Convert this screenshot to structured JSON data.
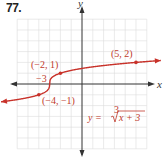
{
  "problem_number": "77.",
  "colors": {
    "curve": "#c8322a",
    "grid": "#dcdcdc",
    "axis": "#333333",
    "label": "#c0392b"
  },
  "chart_data": {
    "type": "line",
    "title": "",
    "xlabel": "x",
    "ylabel": "y",
    "xlim": [
      -6,
      6
    ],
    "ylim": [
      -6,
      6
    ],
    "grid": true,
    "equation": "y = ∛(x + 3)",
    "series": [
      {
        "name": "y = cbrt(x+3)",
        "function": "cbrt(x+3)",
        "x_range": [
          -7.5,
          7.3
        ],
        "arrows_both_ends": true
      }
    ],
    "points": [
      {
        "x": 5,
        "y": 2,
        "label": "(5, 2)"
      },
      {
        "x": -2,
        "y": 1,
        "label": "(−2, 1)"
      },
      {
        "x": -4,
        "y": -1,
        "label": "(−4, −1)"
      },
      {
        "x": -3,
        "y": 0,
        "label": "−3"
      }
    ],
    "annotations": [
      {
        "text": "y = ∛(x + 3)",
        "position": "lower-right quadrant"
      }
    ]
  },
  "labels": {
    "p1": "(5, 2)",
    "p2": "(−2, 1)",
    "p3": "(−4, −1)",
    "p4": "−3",
    "x_axis": "x",
    "y_axis": "y",
    "eq_lhs": "y = ",
    "eq_index": "3",
    "eq_radicand": "x + 3"
  }
}
